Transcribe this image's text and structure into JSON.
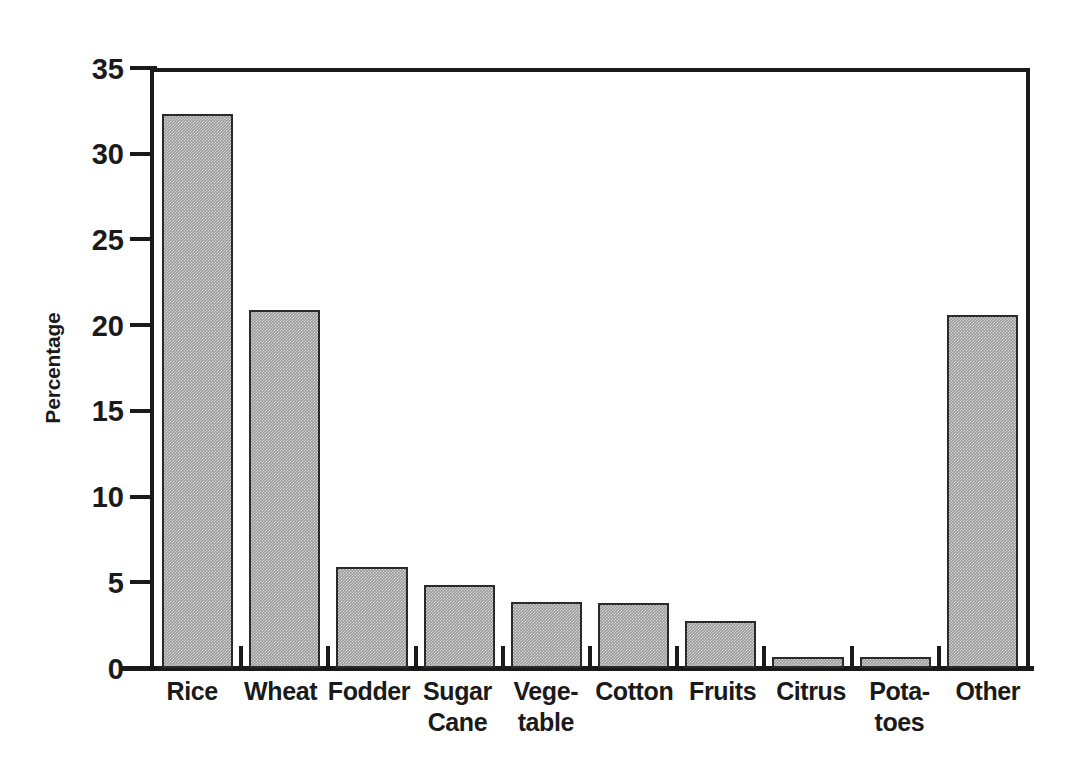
{
  "chart_data": {
    "type": "bar",
    "title": "",
    "xlabel": "",
    "ylabel": "Percentage",
    "ylim": [
      0,
      35
    ],
    "yticks": [
      0,
      5,
      10,
      15,
      20,
      25,
      30,
      35
    ],
    "ytick_labels": [
      "0",
      "5",
      "10",
      "15",
      "20",
      "25",
      "30",
      "35"
    ],
    "grid": false,
    "legend": null,
    "bar_color": "#9a9a9a",
    "bar_edge_color": "#2a2a2a",
    "axis_color": "#1a1a1a",
    "background": "#ffffff",
    "categories": [
      "Rice",
      "Wheat",
      "Fodder",
      "Sugar\nCane",
      "Vege-\ntable",
      "Cotton",
      "Fruits",
      "Citrus",
      "Pota-\ntoes",
      "Other"
    ],
    "values": [
      32.3,
      20.9,
      5.9,
      4.85,
      3.85,
      3.8,
      2.75,
      0.65,
      0.65,
      20.6
    ]
  }
}
